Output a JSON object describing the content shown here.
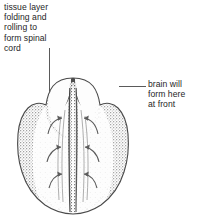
{
  "figure": {
    "name": "neural-plate-embryo-diagram",
    "background_color": "#ffffff",
    "text_color": "#262626",
    "leader_line_color": "#5a5a5a",
    "drawing_ink_color": "#4a4a4a"
  },
  "labels": {
    "left": {
      "text": "tissue layer\nfolding and\nrolling to\nform spinal\ncord",
      "lines": [
        "tissue layer",
        "folding and",
        "rolling to",
        "form spinal",
        "cord"
      ],
      "leader": "vertical-line-down-to-left-lobe"
    },
    "right": {
      "text": "brain will\nform here\nat front",
      "lines": [
        "brain will",
        "form here",
        "at front"
      ],
      "leader": "horizontal-line-left-to-right-lobe"
    }
  },
  "illustration": {
    "subject": "embryo neural plate, dorsal view",
    "style": "stippled engraving",
    "features": [
      "left brain lobe",
      "right brain lobe",
      "central neural groove",
      "neural fold arrows"
    ],
    "arrow_pairs": 3
  }
}
